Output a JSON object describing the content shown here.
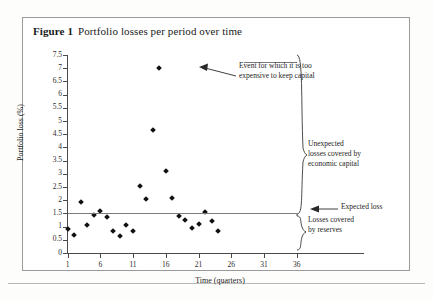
{
  "figure": {
    "label": "Figure 1",
    "caption": "Portfolio losses per period over time"
  },
  "chart_data": {
    "type": "scatter",
    "title": "Portfolio losses per period over time",
    "xlabel": "Time (quarters)",
    "ylabel": "Portfolio loss (%)",
    "xlim": [
      1,
      38
    ],
    "ylim": [
      0,
      7.5
    ],
    "xticks": [
      1,
      6,
      11,
      16,
      21,
      26,
      31,
      36
    ],
    "yticks": [
      0,
      0.5,
      1,
      1.5,
      2,
      2.5,
      3,
      3.5,
      4,
      4.5,
      5,
      5.5,
      6,
      6.5,
      7,
      7.5
    ],
    "grid": false,
    "legend": "none",
    "marker": "diamond",
    "marker_color": "#111111",
    "x": [
      1,
      2,
      3,
      4,
      5,
      6,
      7,
      8,
      9,
      10,
      11,
      12,
      13,
      14,
      15,
      16,
      17,
      18,
      19,
      20,
      21,
      22,
      23,
      24
    ],
    "values": [
      0.9,
      0.7,
      1.95,
      1.05,
      1.45,
      1.6,
      1.35,
      0.85,
      0.65,
      1.05,
      0.85,
      2.55,
      2.05,
      4.65,
      7.0,
      3.1,
      2.1,
      1.4,
      1.25,
      0.95,
      1.1,
      1.55,
      1.2,
      0.85
    ],
    "reference_lines": [
      {
        "name": "expected-loss-line",
        "y": 1.5,
        "color": "#7b7b7b",
        "label": "Expected loss",
        "x_start": 1,
        "x_end": 36
      },
      {
        "name": "economic-capital-line",
        "y": 7.25,
        "color": "#7b7b7b",
        "x_start": 28,
        "x_end": 36
      }
    ],
    "annotations": [
      {
        "name": "outlier-callout",
        "text": "Event for which it is too expensive to keep capital",
        "lines": [
          "Event for which it is too",
          "expensive to keep capital"
        ],
        "points_to_x": 15,
        "points_to_y": 7.0
      },
      {
        "name": "unexpected-losses-bracket",
        "text": "Unexpected losses covered by economic capital",
        "lines": [
          "Unexpected",
          "losses covered by",
          "economic capital"
        ],
        "spans_y": [
          1.5,
          7.5
        ]
      },
      {
        "name": "expected-loss-label",
        "text": "Expected loss",
        "lines": [
          "Expected loss"
        ],
        "points_to_y": 1.5
      },
      {
        "name": "reserves-bracket",
        "text": "Losses covered by reserves",
        "lines": [
          "Losses covered",
          "by reserves"
        ],
        "spans_y": [
          0,
          1.5
        ]
      }
    ]
  }
}
